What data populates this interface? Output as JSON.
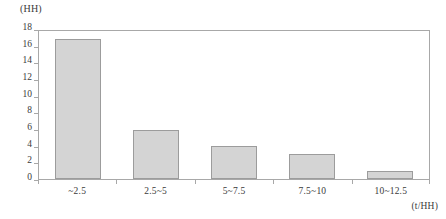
{
  "chart_data": {
    "type": "bar",
    "title": "",
    "subtitle": "",
    "categories": [
      "~2.5",
      "2.5~5",
      "5~7.5",
      "7.5~10",
      "10~12.5"
    ],
    "values": [
      17,
      6,
      4,
      3,
      1
    ],
    "series": [
      {
        "name": "",
        "values": [
          17,
          6,
          4,
          3,
          1
        ]
      }
    ],
    "xlabel": "(t/HH)",
    "ylabel": "(HH)",
    "ylim": [
      0,
      18
    ],
    "ytick_step": 2,
    "yticks": [
      18,
      16,
      14,
      12,
      10,
      8,
      6,
      4,
      2,
      0
    ],
    "ytick_labels": [
      "18",
      "16",
      "14",
      "12",
      "10",
      "8",
      "6",
      "4",
      "2",
      "0"
    ],
    "grid": false,
    "legend": false,
    "legend_position": "none",
    "bar_color": "#d4d4d4",
    "bar_border_color": "#9c9c9c",
    "axis_color": "#a8a8a8",
    "text_color": "#3a3a3a",
    "background": "#ffffff"
  }
}
